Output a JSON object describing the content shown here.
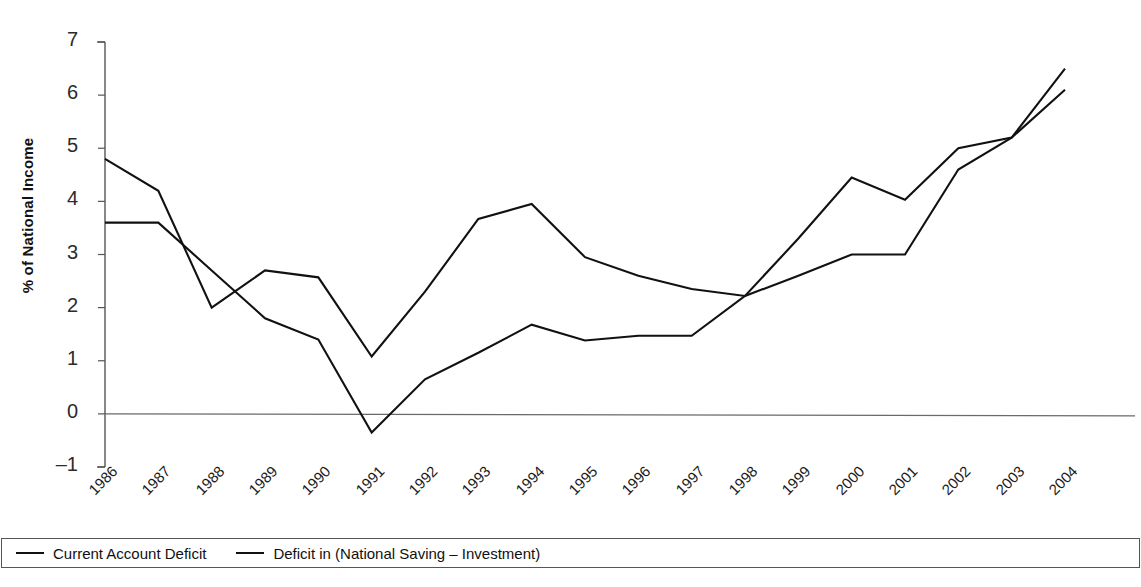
{
  "chart_data": {
    "type": "line",
    "title": "",
    "xlabel": "",
    "ylabel": "% of National Income",
    "categories": [
      "1986",
      "1987",
      "1988",
      "1989",
      "1990",
      "1991",
      "1992",
      "1993",
      "1994",
      "1995",
      "1996",
      "1997",
      "1998",
      "1999",
      "2000",
      "2001",
      "2002",
      "2003",
      "2004"
    ],
    "ylim": [
      -1,
      7
    ],
    "yticks": [
      -1,
      0,
      1,
      2,
      3,
      4,
      5,
      6,
      7
    ],
    "grid": false,
    "zero_line": true,
    "legend_position": "bottom",
    "series": [
      {
        "name": "Current Account Deficit",
        "color": "#111111",
        "values": [
          3.6,
          3.6,
          2.7,
          1.8,
          1.4,
          -0.35,
          0.65,
          1.15,
          1.68,
          1.38,
          1.47,
          1.47,
          2.22,
          2.6,
          3.0,
          3.0,
          4.6,
          5.2,
          6.1
        ]
      },
      {
        "name": "Deficit in (National Saving – Investment)",
        "color": "#111111",
        "values": [
          4.8,
          4.2,
          2.0,
          2.7,
          2.57,
          1.08,
          2.3,
          3.67,
          3.95,
          2.95,
          2.6,
          2.35,
          2.22,
          3.3,
          4.45,
          4.03,
          5.0,
          5.2,
          6.5
        ]
      }
    ]
  },
  "axis": {
    "y_title": "% of National Income",
    "y_tick_labels": [
      "7",
      "6",
      "5",
      "4",
      "3",
      "2",
      "1",
      "0",
      "–1"
    ],
    "x_tick_labels": [
      "1986",
      "1987",
      "1988",
      "1989",
      "1990",
      "1991",
      "1992",
      "1993",
      "1994",
      "1995",
      "1996",
      "1997",
      "1998",
      "1999",
      "2000",
      "2001",
      "2002",
      "2003",
      "2004"
    ]
  },
  "legend": {
    "items": [
      {
        "label": "Current Account Deficit"
      },
      {
        "label": "Deficit in (National Saving – Investment)"
      }
    ]
  }
}
